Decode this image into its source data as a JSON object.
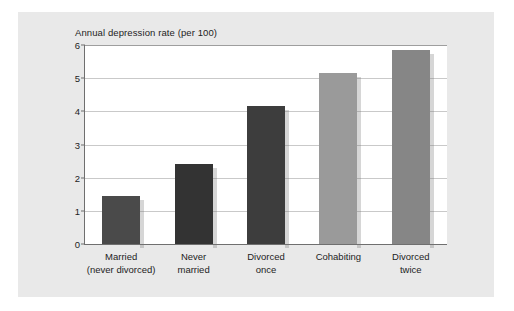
{
  "chart_data": {
    "type": "bar",
    "title": "Annual depression rate (per 100)",
    "xlabel": "",
    "ylabel": "",
    "ylim": [
      0,
      6
    ],
    "yticks": [
      0,
      1,
      2,
      3,
      4,
      5,
      6
    ],
    "grid": true,
    "legend": "none",
    "categories": [
      "Married\n(never divorced)",
      "Never\nmarried",
      "Divorced\nonce",
      "Cohabiting",
      "Divorced\ntwice"
    ],
    "values": [
      1.45,
      2.4,
      4.15,
      5.15,
      5.85
    ],
    "bar_colors": [
      "#4a4a4a",
      "#333333",
      "#3d3d3d",
      "#9a9a9a",
      "#868686"
    ]
  },
  "categories_display": [
    {
      "line1": "Married",
      "line2": "(never divorced)"
    },
    {
      "line1": "Never",
      "line2": "married"
    },
    {
      "line1": "Divorced",
      "line2": "once"
    },
    {
      "line1": "Cohabiting",
      "line2": ""
    },
    {
      "line1": "Divorced",
      "line2": "twice"
    }
  ],
  "colors": {
    "figure_background": "#e9e9e9",
    "plot_background": "#ffffff",
    "axis": "#6f6f6f",
    "gridline": "#c9c9c9",
    "text": "#1d1d1d"
  }
}
